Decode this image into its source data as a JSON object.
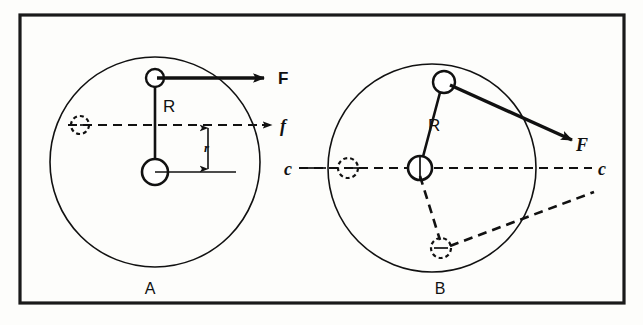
{
  "figure": {
    "background_color": "#fdfdfb",
    "ink_color": "#111111",
    "frame": {
      "x": 20,
      "y": 15,
      "width": 604,
      "height": 288
    },
    "panels": [
      {
        "id": "A",
        "label": "A",
        "label_x": 150,
        "label_y": 294,
        "description": "Crank and connecting force in line with axis",
        "circle": {
          "cx": 155,
          "cy": 162,
          "r": 105
        },
        "center_hub": {
          "cx": 155,
          "cy": 172,
          "r": 13
        },
        "crank_pin": {
          "cx": 155,
          "cy": 78,
          "r": 9
        },
        "ghost_hub": {
          "cx": 80,
          "cy": 125,
          "r": 9
        },
        "radius_label": "R",
        "radius_label_x": 163,
        "radius_label_y": 112,
        "force_label": "F",
        "force_label_y": 76,
        "friction_label": "f",
        "friction_label_y": 128,
        "dimension_label": "r",
        "dimension_label_x": 208,
        "dimension_label_y": 150
      },
      {
        "id": "B",
        "label": "B",
        "label_x": 440,
        "label_y": 294,
        "description": "Crank rotated with force at an angle to axis",
        "circle": {
          "cx": 432,
          "cy": 168,
          "r": 104
        },
        "center_hub": {
          "cx": 420,
          "cy": 168,
          "r": 12
        },
        "crank_pin": {
          "cx": 444,
          "cy": 82,
          "r": 11
        },
        "ghost_hub_left": {
          "cx": 348,
          "cy": 168,
          "r": 10
        },
        "ghost_pin_lower": {
          "cx": 441,
          "cy": 248,
          "r": 10
        },
        "radius_label": "R",
        "radius_label_x": 428,
        "radius_label_y": 131,
        "force_label": "F",
        "force_label_x": 581,
        "force_label_y": 144,
        "axis_label_left": "c",
        "axis_label_left_x": 288,
        "axis_label_left_y": 174,
        "axis_label_right": "c",
        "axis_label_right_x": 600,
        "axis_label_right_y": 174
      }
    ],
    "caption_labels": [
      "A",
      "B"
    ],
    "symbol_glossary": [
      {
        "symbol": "F",
        "meaning": "applied force"
      },
      {
        "symbol": "f",
        "meaning": "friction force line"
      },
      {
        "symbol": "R",
        "meaning": "crank radius"
      },
      {
        "symbol": "r",
        "meaning": "offset distance"
      },
      {
        "symbol": "c",
        "meaning": "center line"
      }
    ]
  }
}
